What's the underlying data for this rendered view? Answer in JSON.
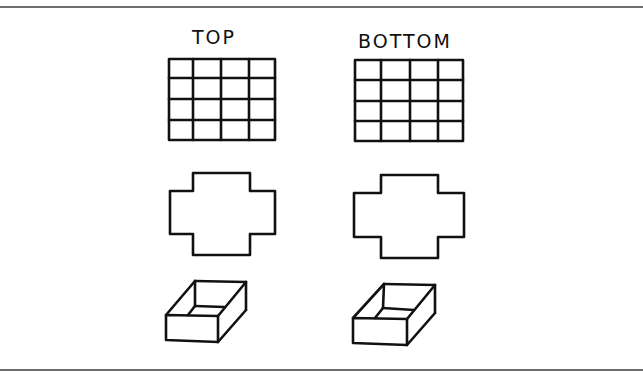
{
  "columns": [
    {
      "label": "TOP",
      "grid": {
        "rows": 4,
        "cols": 4
      },
      "shapes": [
        "grid",
        "cross-outline",
        "open-box"
      ]
    },
    {
      "label": "BOTTOM",
      "grid": {
        "rows": 4,
        "cols": 4
      },
      "shapes": [
        "grid",
        "cross-outline",
        "open-box"
      ]
    }
  ],
  "colors": {
    "line": "#111111",
    "rule": "#6e6e6e",
    "background": "#ffffff"
  }
}
